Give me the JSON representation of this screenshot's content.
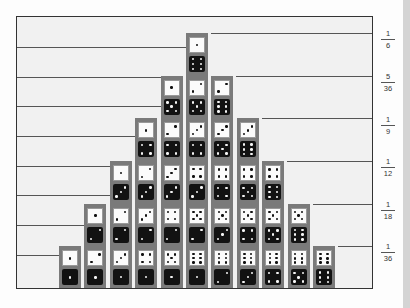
{
  "chart_data": {
    "type": "bar",
    "title": "",
    "xlabel": "",
    "ylabel": "",
    "categories": [
      "2",
      "3",
      "4",
      "5",
      "6",
      "7",
      "8",
      "9",
      "10",
      "11",
      "12"
    ],
    "values": [
      1,
      2,
      3,
      4,
      5,
      6,
      5,
      4,
      3,
      2,
      1
    ],
    "probabilities": [
      "1/36",
      "1/18",
      "1/12",
      "1/9",
      "5/36",
      "1/6",
      "5/36",
      "1/9",
      "1/12",
      "1/18",
      "1/36"
    ],
    "y_tick_labels": [
      {
        "num": "1",
        "den": "6"
      },
      {
        "num": "5",
        "den": "36"
      },
      {
        "num": "1",
        "den": "9"
      },
      {
        "num": "1",
        "den": "12"
      },
      {
        "num": "1",
        "den": "18"
      },
      {
        "num": "1",
        "den": "36"
      }
    ],
    "ylim": [
      0,
      6
    ],
    "grid": true,
    "legend": null
  },
  "colors": {
    "column": "#7a7a7a",
    "white_die": "#fbfbfb",
    "black_die": "#121212",
    "frame_bg": "#f1f1f1",
    "grid_line": "#555555"
  }
}
